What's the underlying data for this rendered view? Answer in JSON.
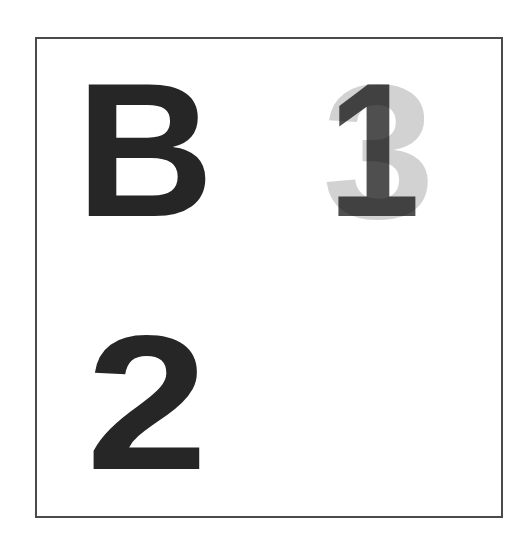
{
  "frame": {
    "border_color": "#4a4a4a",
    "background": "#ffffff"
  },
  "glyphs": {
    "top_left": {
      "char": "B",
      "color": "#262626"
    },
    "top_right_back": {
      "char": "3",
      "color": "#d2d2d2"
    },
    "top_right_front": {
      "char": "1",
      "color": "#4f4f4f"
    },
    "bottom_left": {
      "char": "2",
      "color": "#262626"
    }
  }
}
